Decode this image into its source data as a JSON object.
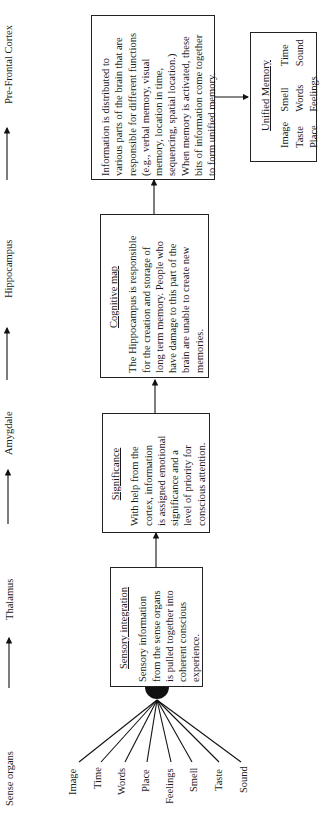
{
  "stages": [
    {
      "label": "Sense organs"
    },
    {
      "label": "Thalamus"
    },
    {
      "label": "Amygdale"
    },
    {
      "label": "Hippocampus"
    },
    {
      "label": "Pre-Frontal Cortex"
    }
  ],
  "boxes": {
    "sensory": {
      "title": "Sensory integration",
      "lines": [
        "Sensory information",
        "from the sense organs",
        "is pulled together into",
        "coherent conscious",
        "experience."
      ]
    },
    "significance": {
      "title": "Significance",
      "lines": [
        "With help from the",
        "cortex, information",
        "is assigned emotional",
        "significance and a",
        "level of priority for",
        "conscious attention."
      ]
    },
    "cognitive": {
      "title": "Cognitive map",
      "lines": [
        "The Hippocampus is responsible",
        "for the creation and storage of",
        "long term memory. People who",
        "have damage to this part of the",
        "brain are unable to create new",
        "memories."
      ]
    },
    "distributed": {
      "lines": [
        "Information is distributed to",
        "various parts of the brain that are",
        "responsible for different functions",
        "(e.g., verbal memory, visual",
        "memory, location in time,",
        "sequencing, spatial location.)",
        "When memory is activated, these",
        "bits of information come together",
        "to form unified memory."
      ]
    },
    "unified": {
      "title": "Unified Memory",
      "items": [
        "Image",
        "Smell",
        "Time",
        "Taste",
        "Words",
        "Sound",
        "Place",
        "Feelings",
        ""
      ]
    }
  },
  "senses": [
    "Image",
    "Time",
    "Words",
    "Place",
    "Feelings",
    "Smell",
    "Taste",
    "Sound"
  ]
}
